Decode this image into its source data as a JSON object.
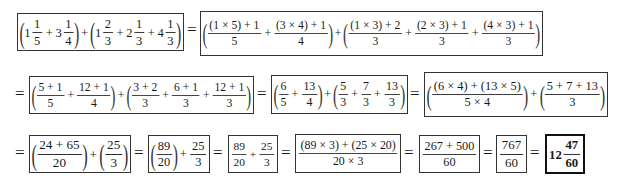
{
  "rows": [
    {
      "steps": [
        {
          "id": "r1b1",
          "terms": [
            {
              "group": [
                {
                  "whole": "1",
                  "num": "1",
                  "den": "5"
                },
                {
                  "op": "+"
                },
                {
                  "whole": "3",
                  "num": "1",
                  "den": "4"
                }
              ]
            },
            {
              "op": "+"
            },
            {
              "group": [
                {
                  "whole": "1",
                  "num": "2",
                  "den": "3"
                },
                {
                  "op": "+"
                },
                {
                  "whole": "2",
                  "num": "1",
                  "den": "3"
                },
                {
                  "op": "+"
                },
                {
                  "whole": "4",
                  "num": "1",
                  "den": "3"
                }
              ]
            }
          ]
        },
        {
          "id": "r1b2",
          "terms": [
            {
              "group": [
                {
                  "num": "(1 × 5) + 1",
                  "den": "5"
                },
                {
                  "op": "+"
                },
                {
                  "num": "(3 × 4) + 1",
                  "den": "4"
                }
              ]
            },
            {
              "op": "+"
            },
            {
              "group": [
                {
                  "num": "(1 × 3) + 2",
                  "den": "3"
                },
                {
                  "op": "+"
                },
                {
                  "num": "(2 × 3) + 1",
                  "den": "3"
                },
                {
                  "op": "+"
                },
                {
                  "num": "(4 × 3) + 1",
                  "den": "3"
                }
              ]
            }
          ]
        }
      ]
    },
    {
      "steps": [
        {
          "id": "r2b1",
          "terms": [
            {
              "group": [
                {
                  "num": "5 + 1",
                  "den": "5"
                },
                {
                  "op": "+"
                },
                {
                  "num": "12 + 1",
                  "den": "4"
                }
              ]
            },
            {
              "op": "+"
            },
            {
              "group": [
                {
                  "num": "3 + 2",
                  "den": "3"
                },
                {
                  "op": "+"
                },
                {
                  "num": "6 + 1",
                  "den": "3"
                },
                {
                  "op": "+"
                },
                {
                  "num": "12 + 1",
                  "den": "3"
                }
              ]
            }
          ]
        },
        {
          "id": "r2b2",
          "terms": [
            {
              "group": [
                {
                  "num": "6",
                  "den": "5"
                },
                {
                  "op": "+"
                },
                {
                  "num": "13",
                  "den": "4"
                }
              ]
            },
            {
              "op": "+"
            },
            {
              "group": [
                {
                  "num": "5",
                  "den": "3"
                },
                {
                  "op": "+"
                },
                {
                  "num": "7",
                  "den": "3"
                },
                {
                  "op": "+"
                },
                {
                  "num": "13",
                  "den": "3"
                }
              ]
            }
          ]
        },
        {
          "id": "r2b3",
          "terms": [
            {
              "group": [
                {
                  "num": "(6 × 4) + (13 × 5)",
                  "den": "5 × 4"
                }
              ]
            },
            {
              "op": "+"
            },
            {
              "group": [
                {
                  "num": "5 + 7 + 13",
                  "den": "3"
                }
              ]
            }
          ]
        }
      ]
    },
    {
      "steps": [
        {
          "id": "r3b1",
          "terms": [
            {
              "group": [
                {
                  "num": "24 + 65",
                  "den": "20"
                }
              ]
            },
            {
              "op": "+"
            },
            {
              "group": [
                {
                  "num": "25",
                  "den": "3"
                }
              ]
            }
          ]
        },
        {
          "id": "r3b2",
          "terms": [
            {
              "group": [
                {
                  "num": "89",
                  "den": "20"
                }
              ]
            },
            {
              "op": "+"
            },
            {
              "num": "25",
              "den": "3"
            }
          ]
        },
        {
          "id": "r3b3",
          "terms": [
            {
              "num": "89",
              "den": "20"
            },
            {
              "op": "+"
            },
            {
              "num": "25",
              "den": "3"
            }
          ]
        },
        {
          "id": "r3b4",
          "terms": [
            {
              "num": "(89 × 3) + (25 × 20)",
              "den": "20 × 3"
            }
          ]
        },
        {
          "id": "r3b5",
          "terms": [
            {
              "num": "267 + 500",
              "den": "60"
            }
          ]
        },
        {
          "id": "r3b6",
          "terms": [
            {
              "num": "767",
              "den": "60"
            }
          ]
        },
        {
          "id": "r3b7",
          "final": true,
          "terms": [
            {
              "whole": "12",
              "num": "47",
              "den": "60"
            }
          ]
        }
      ]
    }
  ],
  "equals_sign": "="
}
